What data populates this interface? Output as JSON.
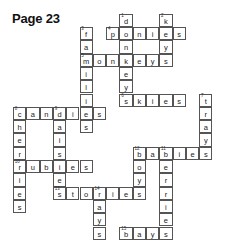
{
  "title": "Page 23",
  "grid": {
    "origin_x": 13,
    "origin_y": 13.7,
    "cell_size": 13.3,
    "words": [
      {
        "num": "1",
        "word": "donkeys",
        "dir": "down",
        "col": 8,
        "row": 0
      },
      {
        "num": "2",
        "word": "keys",
        "dir": "down",
        "col": 11,
        "row": 0
      },
      {
        "num": "3",
        "word": "families",
        "dir": "down",
        "col": 5,
        "row": 1
      },
      {
        "num": "4",
        "word": "ponies",
        "dir": "across",
        "col": 7,
        "row": 1
      },
      {
        "num": "5",
        "word": "monkeys",
        "dir": "across",
        "col": 5,
        "row": 3
      },
      {
        "num": "6",
        "word": "skies",
        "dir": "across",
        "col": 8,
        "row": 6
      },
      {
        "num": "7",
        "word": "trays",
        "dir": "down",
        "col": 14,
        "row": 6
      },
      {
        "num": "8",
        "word": "candies",
        "dir": "across",
        "col": 0,
        "row": 7
      },
      {
        "num": "8",
        "word": "cherries",
        "dir": "down",
        "col": 0,
        "row": 7
      },
      {
        "num": "9",
        "word": "daisies",
        "dir": "down",
        "col": 3,
        "row": 7
      },
      {
        "num": "12",
        "word": "babies",
        "dir": "across",
        "col": 9,
        "row": 10
      },
      {
        "num": "12",
        "word": "boys",
        "dir": "down",
        "col": 9,
        "row": 10
      },
      {
        "num": "11",
        "word": "berries",
        "dir": "down",
        "col": 11,
        "row": 10
      },
      {
        "num": "10",
        "word": "rubies",
        "dir": "across",
        "col": 0,
        "row": 11
      },
      {
        "num": "13",
        "word": "stories",
        "dir": "across",
        "col": 3,
        "row": 13
      },
      {
        "num": "14",
        "word": "rays",
        "dir": "down",
        "col": 6,
        "row": 13
      },
      {
        "num": "15",
        "word": "bays",
        "dir": "across",
        "col": 8,
        "row": 16
      }
    ]
  }
}
